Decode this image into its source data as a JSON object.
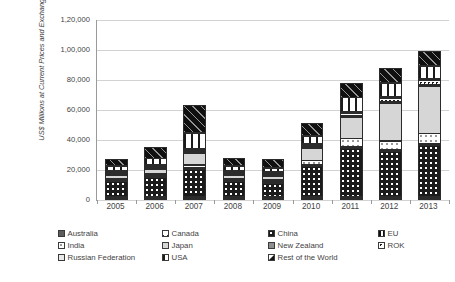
{
  "chart_data": {
    "type": "bar",
    "subtype": "stacked-column",
    "title": "",
    "xlabel": "",
    "ylabel": "US$ Millions at Current Prices and Exchange Rates",
    "categories": [
      "2005",
      "2006",
      "2007",
      "2008",
      "2009",
      "2010",
      "2011",
      "2012",
      "2013"
    ],
    "ylim": [
      0,
      120000
    ],
    "yticks": [
      0,
      20000,
      40000,
      60000,
      80000,
      100000,
      120000
    ],
    "ytick_labels": [
      "0",
      "20,000",
      "40,000",
      "60,000",
      "80,000",
      "1,00,000",
      "1,20,000"
    ],
    "grid": true,
    "legend_position": "bottom",
    "series": [
      {
        "name": "Australia",
        "key": "australia",
        "values": [
          300,
          350,
          500,
          400,
          350,
          600,
          800,
          900,
          1000
        ]
      },
      {
        "name": "Canada",
        "key": "canada",
        "values": [
          200,
          250,
          350,
          250,
          250,
          400,
          600,
          700,
          800
        ]
      },
      {
        "name": "China",
        "key": "china",
        "values": [
          10500,
          13500,
          18500,
          10500,
          9500,
          20500,
          33000,
          30500,
          34500
        ]
      },
      {
        "name": "EU",
        "key": "eu",
        "values": [
          200,
          250,
          400,
          250,
          250,
          450,
          700,
          800,
          900
        ]
      },
      {
        "name": "India",
        "key": "india",
        "values": [
          1200,
          1400,
          2200,
          1300,
          1500,
          3500,
          5500,
          6500,
          7500
        ]
      },
      {
        "name": "Japan",
        "key": "japan",
        "values": [
          2500,
          3500,
          8500,
          2500,
          2500,
          8500,
          14500,
          25500,
          32000
        ]
      },
      {
        "name": "New Zealand",
        "key": "newzealand",
        "values": [
          100,
          120,
          180,
          120,
          120,
          200,
          300,
          350,
          400
        ]
      },
      {
        "name": "ROK",
        "key": "rok",
        "values": [
          400,
          500,
          900,
          500,
          500,
          1200,
          2200,
          2600,
          3000
        ]
      },
      {
        "name": "Russian Federation",
        "key": "russia",
        "values": [
          150,
          180,
          300,
          180,
          180,
          350,
          600,
          700,
          800
        ]
      },
      {
        "name": "USA",
        "key": "usa",
        "values": [
          3500,
          4500,
          10500,
          3500,
          3000,
          5500,
          9500,
          9500,
          9000
        ]
      },
      {
        "name": "Rest of the World",
        "key": "row",
        "values": [
          4950,
          7450,
          18680,
          5500,
          5850,
          8800,
          10300,
          9950,
          10100
        ]
      }
    ],
    "totals": [
      24000,
      32000,
      61000,
      25000,
      24000,
      50000,
      78000,
      88000,
      100000
    ]
  },
  "legend": {
    "items": [
      {
        "label": "Australia",
        "key": "australia",
        "col": 0,
        "row": 0
      },
      {
        "label": "Canada",
        "key": "canada",
        "col": 1,
        "row": 0
      },
      {
        "label": "China",
        "key": "china",
        "col": 2,
        "row": 0
      },
      {
        "label": "EU",
        "key": "eu",
        "col": 3,
        "row": 0
      },
      {
        "label": "India",
        "key": "india",
        "col": 0,
        "row": 1
      },
      {
        "label": "Japan",
        "key": "japan",
        "col": 1,
        "row": 1
      },
      {
        "label": "New Zealand",
        "key": "newzealand",
        "col": 2,
        "row": 1
      },
      {
        "label": "ROK",
        "key": "rok",
        "col": 3,
        "row": 1
      },
      {
        "label": "Russian Federation",
        "key": "russia",
        "col": 0,
        "row": 2
      },
      {
        "label": "USA",
        "key": "usa",
        "col": 1,
        "row": 2
      },
      {
        "label": "Rest of the World",
        "key": "row",
        "col": 2,
        "row": 2
      }
    ]
  },
  "colors": {
    "gridline": "#d2d2d2",
    "axis": "#9a9a9a",
    "text": "#3f3f3f",
    "background": "#ffffff"
  }
}
